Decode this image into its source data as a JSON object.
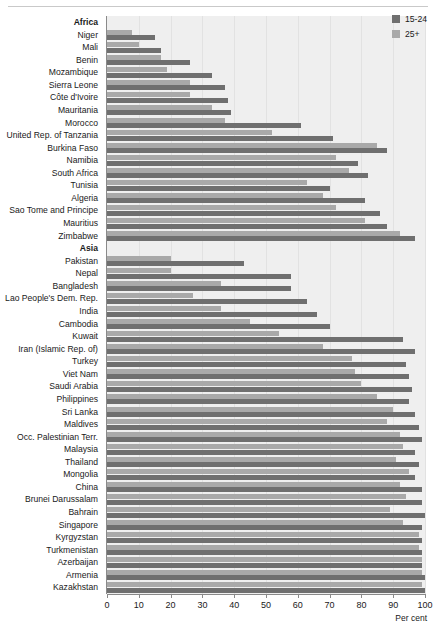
{
  "chart_data": {
    "type": "bar",
    "orientation": "horizontal",
    "title": "",
    "xlabel": "Per cent",
    "ylabel": "",
    "xlim": [
      0,
      100
    ],
    "xticks": [
      0,
      10,
      20,
      30,
      40,
      50,
      60,
      70,
      80,
      90,
      100
    ],
    "grid": true,
    "legend_position": "top-right",
    "series": [
      {
        "name": "15-24",
        "color": "#6f6f6f"
      },
      {
        "name": "25+",
        "color": "#a9a9a9"
      }
    ],
    "rows": [
      {
        "label": "Africa",
        "group": true,
        "values": [
          null,
          null
        ]
      },
      {
        "label": "Niger",
        "group": false,
        "values": [
          15,
          8
        ]
      },
      {
        "label": "Mali",
        "group": false,
        "values": [
          17,
          10
        ]
      },
      {
        "label": "Benin",
        "group": false,
        "values": [
          26,
          17
        ]
      },
      {
        "label": "Mozambique",
        "group": false,
        "values": [
          33,
          19
        ]
      },
      {
        "label": "Sierra Leone",
        "group": false,
        "values": [
          37,
          26
        ]
      },
      {
        "label": "Côte d'Ivoire",
        "group": false,
        "values": [
          38,
          26
        ]
      },
      {
        "label": "Mauritania",
        "group": false,
        "values": [
          39,
          33
        ]
      },
      {
        "label": "Morocco",
        "group": false,
        "values": [
          61,
          37
        ]
      },
      {
        "label": "United Rep. of Tanzania",
        "group": false,
        "values": [
          71,
          52
        ]
      },
      {
        "label": "Burkina Faso",
        "group": false,
        "values": [
          88,
          85
        ]
      },
      {
        "label": "Namibia",
        "group": false,
        "values": [
          79,
          72
        ]
      },
      {
        "label": "South Africa",
        "group": false,
        "values": [
          82,
          76
        ]
      },
      {
        "label": "Tunisia",
        "group": false,
        "values": [
          70,
          63
        ]
      },
      {
        "label": "Algeria",
        "group": false,
        "values": [
          81,
          68
        ]
      },
      {
        "label": "Sao Tome and Principe",
        "group": false,
        "values": [
          86,
          72
        ]
      },
      {
        "label": "Mauritius",
        "group": false,
        "values": [
          88,
          81
        ]
      },
      {
        "label": "Zimbabwe",
        "group": false,
        "values": [
          97,
          92
        ]
      },
      {
        "label": "Asia",
        "group": true,
        "values": [
          null,
          null
        ]
      },
      {
        "label": "Pakistan",
        "group": false,
        "values": [
          43,
          20
        ]
      },
      {
        "label": "Nepal",
        "group": false,
        "values": [
          58,
          20
        ]
      },
      {
        "label": "Bangladesh",
        "group": false,
        "values": [
          58,
          36
        ]
      },
      {
        "label": "Lao People's Dem. Rep.",
        "group": false,
        "values": [
          63,
          27
        ]
      },
      {
        "label": "India",
        "group": false,
        "values": [
          66,
          36
        ]
      },
      {
        "label": "Cambodia",
        "group": false,
        "values": [
          70,
          45
        ]
      },
      {
        "label": "Kuwait",
        "group": false,
        "values": [
          93,
          54
        ]
      },
      {
        "label": "Iran (Islamic Rep. of)",
        "group": false,
        "values": [
          97,
          68
        ]
      },
      {
        "label": "Turkey",
        "group": false,
        "values": [
          94,
          77
        ]
      },
      {
        "label": "Viet Nam",
        "group": false,
        "values": [
          95,
          78
        ]
      },
      {
        "label": "Saudi Arabia",
        "group": false,
        "values": [
          96,
          80
        ]
      },
      {
        "label": "Philippines",
        "group": false,
        "values": [
          95,
          85
        ]
      },
      {
        "label": "Sri Lanka",
        "group": false,
        "values": [
          97,
          90
        ]
      },
      {
        "label": "Maldives",
        "group": false,
        "values": [
          98,
          88
        ]
      },
      {
        "label": "Occ. Palestinian Terr.",
        "group": false,
        "values": [
          99,
          92
        ]
      },
      {
        "label": "Malaysia",
        "group": false,
        "values": [
          97,
          93
        ]
      },
      {
        "label": "Thailand",
        "group": false,
        "values": [
          98,
          91
        ]
      },
      {
        "label": "Mongolia",
        "group": false,
        "values": [
          97,
          95
        ]
      },
      {
        "label": "China",
        "group": false,
        "values": [
          99,
          92
        ]
      },
      {
        "label": "Brunei Darussalam",
        "group": false,
        "values": [
          99,
          94
        ]
      },
      {
        "label": "Bahrain",
        "group": false,
        "values": [
          100,
          89
        ]
      },
      {
        "label": "Singapore",
        "group": false,
        "values": [
          99,
          93
        ]
      },
      {
        "label": "Kyrgyzstan",
        "group": false,
        "values": [
          99,
          98
        ]
      },
      {
        "label": "Turkmenistan",
        "group": false,
        "values": [
          99,
          98
        ]
      },
      {
        "label": "Azerbaijan",
        "group": false,
        "values": [
          99,
          99
        ]
      },
      {
        "label": "Armenia",
        "group": false,
        "values": [
          100,
          99
        ]
      },
      {
        "label": "Kazakhstan",
        "group": false,
        "values": [
          100,
          99
        ]
      }
    ]
  },
  "legend": {
    "items": [
      {
        "label": "15-24",
        "color": "#6f6f6f"
      },
      {
        "label": "25+",
        "color": "#a9a9a9"
      }
    ]
  },
  "axis": {
    "title": "Per cent",
    "ticks": [
      "0",
      "10",
      "20",
      "30",
      "40",
      "50",
      "60",
      "70",
      "80",
      "90",
      "100"
    ]
  }
}
